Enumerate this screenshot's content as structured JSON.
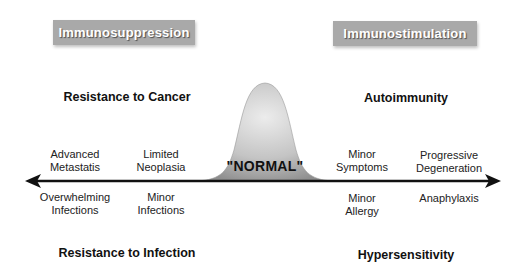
{
  "headers": {
    "left": "Immunosuppression",
    "right": "Immunostimulation"
  },
  "categories": {
    "top_left": "Resistance to Cancer",
    "top_right": "Autoimmunity",
    "bottom_left": "Resistance to Infection",
    "bottom_right": "Hypersensitivity"
  },
  "center": {
    "label": "\"NORMAL\""
  },
  "above_axis": [
    {
      "line1": "Advanced",
      "line2": "Metastatis"
    },
    {
      "line1": "Limited",
      "line2": "Neoplasia"
    },
    {
      "line1": "Minor",
      "line2": "Symptoms"
    },
    {
      "line1": "Progressive",
      "line2": "Degeneration"
    }
  ],
  "below_axis": [
    {
      "line1": "Overwhelming",
      "line2": "Infections"
    },
    {
      "line1": "Minor",
      "line2": "Infections"
    },
    {
      "line1": "Minor",
      "line2": "Allergy"
    },
    {
      "line1": "Anaphylaxis",
      "line2": ""
    }
  ],
  "icons": {
    "axis": "double-headed-arrow",
    "curve": "bell-curve"
  },
  "colors": {
    "header_box": "#a9a9a9",
    "curve_fill_light": "#e8e8e8",
    "curve_fill_dark": "#9a9a9a",
    "axis": "#111111"
  }
}
